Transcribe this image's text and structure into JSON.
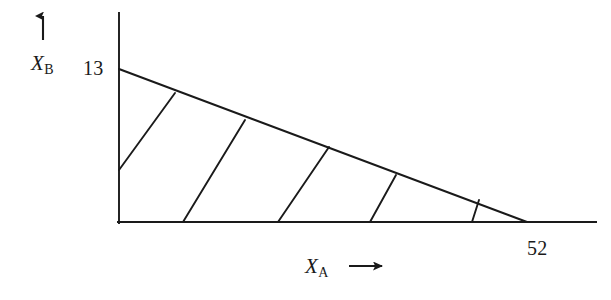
{
  "figure": {
    "background_color": "#ffffff",
    "ink_color": "#1a1a1a"
  },
  "axes": {
    "y_axis": {
      "label": "X",
      "subscript": "B",
      "arrow_icon": "arrow-up-icon",
      "intercept_value": "13",
      "line": {
        "x": 119,
        "y_top": 12,
        "y_bottom": 224
      }
    },
    "x_axis": {
      "label": "X",
      "subscript": "A",
      "arrow_icon": "arrow-right-icon",
      "intercept_value": "52",
      "line": {
        "y": 222,
        "x_left": 117,
        "x_right": 597
      }
    }
  },
  "chart_data": {
    "type": "line",
    "xlabel": "X_A",
    "ylabel": "X_B",
    "xlim": [
      0,
      52
    ],
    "ylim": [
      0,
      13
    ],
    "grid": false,
    "legend": null,
    "tick_labels": {
      "x": [
        "52"
      ],
      "y": [
        "13"
      ]
    },
    "annotations": [
      {
        "text": "13",
        "axis": "y",
        "value": 13
      },
      {
        "text": "52",
        "axis": "x",
        "value": 52
      }
    ],
    "series": [
      {
        "name": "constraint-line",
        "description": "Hypotenuse from y-intercept (0,13) to x-intercept (52,0)",
        "x": [
          0,
          52
        ],
        "y": [
          13,
          0
        ]
      }
    ],
    "hatch_lines": [
      {
        "name": "hatch-1",
        "from": [
          119,
          170
        ],
        "to": [
          175,
          93
        ]
      },
      {
        "name": "hatch-2",
        "from": [
          183,
          222
        ],
        "to": [
          245,
          120
        ]
      },
      {
        "name": "hatch-3",
        "from": [
          278,
          222
        ],
        "to": [
          329,
          147
        ]
      },
      {
        "name": "hatch-4",
        "from": [
          370,
          222
        ],
        "to": [
          396,
          175
        ]
      },
      {
        "name": "hatch-5",
        "from": [
          472,
          222
        ],
        "to": [
          479,
          200
        ]
      }
    ],
    "region_vertices": [
      [
        119,
        222
      ],
      [
        119,
        69
      ],
      [
        527,
        222
      ]
    ]
  }
}
